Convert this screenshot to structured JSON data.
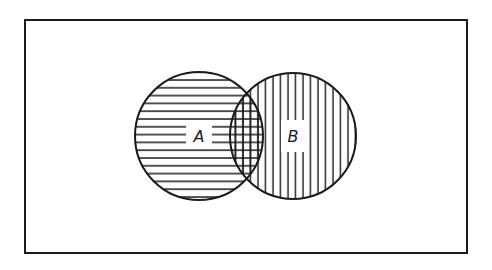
{
  "diagram": {
    "type": "venn",
    "universe": {
      "label": "",
      "x": 25,
      "y": 20,
      "width": 442,
      "height": 233
    },
    "sets": [
      {
        "name": "A",
        "label": "A",
        "cx": 199,
        "cy": 136,
        "r": 64,
        "hatch": "horizontal",
        "hatch_spacing": 7.8
      },
      {
        "name": "B",
        "label": "B",
        "cx": 293,
        "cy": 136,
        "r": 63,
        "hatch": "vertical",
        "hatch_spacing": 7.5
      }
    ],
    "intersection": {
      "sets": [
        "A",
        "B"
      ],
      "hatch": "cross"
    },
    "colors": {
      "stroke": "#1a1a1a",
      "background": "#ffffff"
    }
  }
}
